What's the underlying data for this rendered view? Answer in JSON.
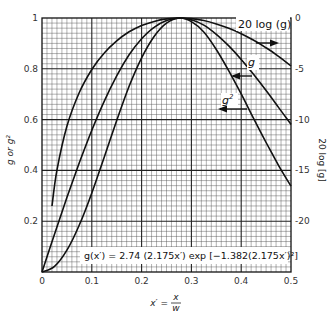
{
  "chart_data": {
    "type": "line",
    "title": "",
    "formula": "g(x′) = 2.74 (2.175x′) exp [−1.382(2.175x′)²]",
    "xlabel": "x′ = x / w",
    "xlabel_num": "x",
    "xlabel_den": "w",
    "xlabel_lhs": "x′ =",
    "ylabel": "g or g²",
    "ylabel_right": "20 log [g]",
    "xlim": [
      0,
      0.5
    ],
    "ylim": [
      0,
      1
    ],
    "ylim_right": [
      -25,
      0
    ],
    "grid": true,
    "x_ticks": [
      {
        "value": 0,
        "label": "0"
      },
      {
        "value": 0.1,
        "label": "0.1"
      },
      {
        "value": 0.2,
        "label": "0.2"
      },
      {
        "value": 0.3,
        "label": "0.3"
      },
      {
        "value": 0.4,
        "label": "0.4"
      },
      {
        "value": 0.5,
        "label": "0.5"
      }
    ],
    "y_ticks": [
      {
        "value": 0.2,
        "label": "0.2"
      },
      {
        "value": 0.4,
        "label": "0.4"
      },
      {
        "value": 0.6,
        "label": "0.6"
      },
      {
        "value": 0.8,
        "label": "0.8"
      },
      {
        "value": 1,
        "label": "1"
      }
    ],
    "y_ticks_right": [
      {
        "value": 0,
        "label": "0"
      },
      {
        "value": -5,
        "label": "-5"
      },
      {
        "value": -10,
        "label": "-10"
      },
      {
        "value": -15,
        "label": "-15"
      },
      {
        "value": -20,
        "label": "-20"
      }
    ],
    "series": [
      {
        "name": "g",
        "axis": "left",
        "label": "g",
        "arrow": "left",
        "x": [
          0,
          0.025,
          0.05,
          0.075,
          0.1,
          0.125,
          0.15,
          0.175,
          0.2,
          0.225,
          0.25,
          0.2766,
          0.3,
          0.325,
          0.35,
          0.375,
          0.4,
          0.425,
          0.45,
          0.475,
          0.5
        ],
        "y": [
          0,
          0.149,
          0.293,
          0.43,
          0.558,
          0.673,
          0.772,
          0.855,
          0.918,
          0.963,
          0.99,
          1.0,
          0.993,
          0.972,
          0.936,
          0.89,
          0.837,
          0.777,
          0.714,
          0.648,
          0.581
        ]
      },
      {
        "name": "g²",
        "axis": "left",
        "label": "g²",
        "arrow": "left",
        "x": [
          0,
          0.025,
          0.05,
          0.075,
          0.1,
          0.125,
          0.15,
          0.175,
          0.2,
          0.225,
          0.25,
          0.2766,
          0.3,
          0.325,
          0.35,
          0.375,
          0.4,
          0.425,
          0.45,
          0.475,
          0.5
        ],
        "y": [
          0,
          0.022,
          0.086,
          0.185,
          0.311,
          0.453,
          0.596,
          0.731,
          0.843,
          0.927,
          0.98,
          1.0,
          0.986,
          0.945,
          0.876,
          0.792,
          0.701,
          0.604,
          0.51,
          0.42,
          0.338
        ]
      },
      {
        "name": "20 log (g)",
        "axis": "right",
        "label": "20 log (g)",
        "arrow": "right",
        "x": [
          0.02,
          0.03,
          0.05,
          0.075,
          0.1,
          0.125,
          0.15,
          0.175,
          0.2,
          0.225,
          0.25,
          0.2766,
          0.3,
          0.325,
          0.35,
          0.375,
          0.4,
          0.425,
          0.45,
          0.475,
          0.5
        ],
        "y": [
          -18.5,
          -15.0,
          -10.66,
          -7.33,
          -5.07,
          -3.44,
          -2.25,
          -1.36,
          -0.74,
          -0.33,
          -0.09,
          0.0,
          -0.06,
          -0.25,
          -0.58,
          -1.01,
          -1.55,
          -2.19,
          -2.93,
          -3.77,
          -4.72
        ]
      }
    ]
  },
  "labels": {
    "series_g": "g",
    "series_g2": "g",
    "series_g2_sup": "2",
    "series_db": "20 log (g)"
  }
}
